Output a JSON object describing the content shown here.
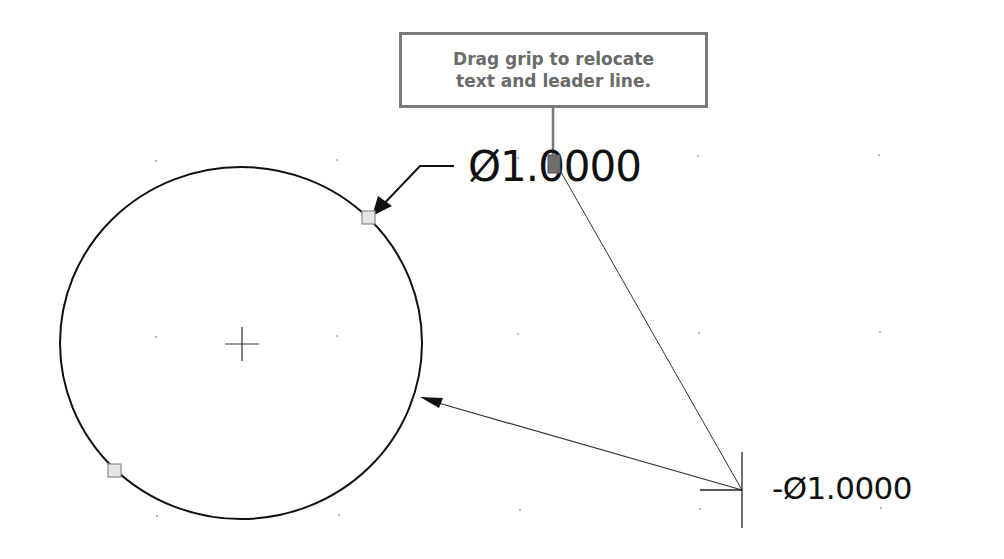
{
  "callout": {
    "line1": "Drag grip to relocate",
    "line2": "text and leader line.",
    "border_color": "#7a7a7a",
    "text_color": "#6a6a6a"
  },
  "dimensions": {
    "top": {
      "text": "Ø1.0000"
    },
    "bottom": {
      "text": "-Ø1.0000"
    }
  },
  "drawing": {
    "circle": {
      "cx": 241,
      "cy": 343,
      "rx": 181,
      "ry": 176,
      "stroke": "#111111"
    },
    "center_mark": {
      "x": 242,
      "y": 344,
      "size": 16
    },
    "grips": [
      {
        "name": "grip-circle-top-right",
        "x": 368,
        "y": 218
      },
      {
        "name": "grip-circle-bottom-left",
        "x": 114,
        "y": 471
      }
    ],
    "text_grip": {
      "x": 553,
      "y": 164
    },
    "colors": {
      "grip_fill": "#e6e6e6",
      "grip_stroke": "#8a8a8a",
      "text_grip_fill": "#6e6e6e",
      "line": "#111111",
      "thin_line": "#333333",
      "grid_dot": "#9a9a9a"
    }
  }
}
